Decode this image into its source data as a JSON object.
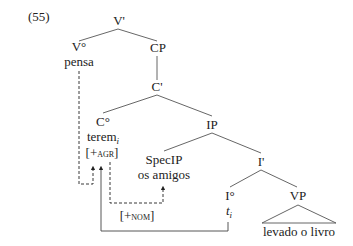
{
  "example_number": "(55)",
  "nodes": {
    "vbar": "V'",
    "v0": "V°",
    "v0_word": "pensa",
    "cp": "CP",
    "cbar": "C'",
    "c0": "C°",
    "c0_word": "terem",
    "c0_index": "i",
    "c0_feature_open": "[+",
    "c0_feature": "agr",
    "c0_feature_close": "]",
    "ip": "IP",
    "specip": "SpecIP",
    "specip_words": "os amigos",
    "ibar": "I'",
    "i0": "I°",
    "i0_trace": "t",
    "i0_trace_index": "i",
    "vp": "VP",
    "vp_words": "levado o livro"
  },
  "annotations": {
    "nom_open": "[+",
    "nom_feature": "nom",
    "nom_close": "]"
  },
  "colors": {
    "line": "#444444",
    "text": "#222222"
  }
}
